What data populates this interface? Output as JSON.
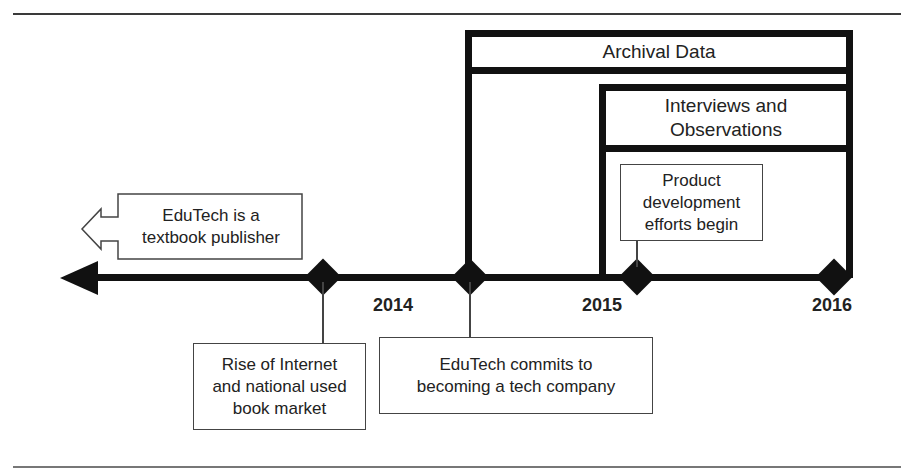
{
  "figure": {
    "type": "timeline",
    "data_sources": [
      {
        "label": "Archival Data",
        "start_year": "2014-2015 (EduTech commits to tech)",
        "end": "2016"
      },
      {
        "label_lines": [
          "Interviews and",
          "Observations"
        ],
        "start": "2015",
        "end": "2016"
      }
    ],
    "years": [
      "2014",
      "2015",
      "2016"
    ],
    "events": {
      "past": {
        "lines": [
          "EduTech is a",
          "textbook publisher"
        ]
      },
      "rise_internet": {
        "lines": [
          "Rise of Internet",
          "and national used",
          "book market"
        ]
      },
      "commits_tech": {
        "lines": [
          "EduTech commits to",
          "becoming a tech company"
        ]
      },
      "product_dev": {
        "lines": [
          "Product",
          "development",
          "efforts begin"
        ]
      }
    },
    "colors": {
      "line": "#111111",
      "box_border": "#444444",
      "text": "#222222",
      "background": "#ffffff"
    }
  },
  "labels": {
    "archival": "Archival Data",
    "interviews_1": "Interviews and",
    "interviews_2": "Observations",
    "year_2014": "2014",
    "year_2015": "2015",
    "year_2016": "2016"
  }
}
